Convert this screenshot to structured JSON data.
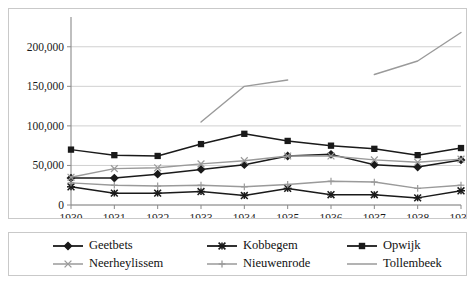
{
  "chart_data": {
    "type": "line",
    "title": "",
    "xlabel": "",
    "ylabel": "",
    "x": [
      1930,
      1931,
      1932,
      1933,
      1934,
      1935,
      1936,
      1937,
      1938,
      1939
    ],
    "xtick_labels": [
      "1930",
      "1931",
      "1932",
      "1933",
      "1934",
      "1935",
      "1936",
      "1937",
      "1938",
      "1939"
    ],
    "ytick_labels": [
      "0",
      "50,000",
      "100,000",
      "150,000",
      "200,000"
    ],
    "ytick_values": [
      0,
      50000,
      100000,
      150000,
      200000
    ],
    "ylim": [
      0,
      225000
    ],
    "xlim": [
      1930,
      1939
    ],
    "grid": true,
    "legend_position": "bottom",
    "series": [
      {
        "name": "Geetbets",
        "marker": "diamond",
        "color": "#1a1a1a",
        "values": [
          34000,
          34000,
          39000,
          45000,
          51000,
          62000,
          64000,
          51000,
          48000,
          57000
        ]
      },
      {
        "name": "Kobbegem",
        "marker": "asterisk",
        "color": "#1a1a1a",
        "values": [
          23000,
          15000,
          15000,
          17000,
          12000,
          21000,
          13000,
          13000,
          9000,
          18000
        ]
      },
      {
        "name": "Opwijk",
        "marker": "square",
        "color": "#1a1a1a",
        "values": [
          70000,
          63000,
          62000,
          77000,
          90000,
          81000,
          75000,
          71000,
          63000,
          72000
        ]
      },
      {
        "name": "Neerheylissem",
        "marker": "x",
        "color": "#9a9a9a",
        "values": [
          35000,
          46000,
          47000,
          52000,
          56000,
          62000,
          62000,
          57000,
          54000,
          58000
        ]
      },
      {
        "name": "Nieuwenrode",
        "marker": "plus",
        "color": "#9a9a9a",
        "values": [
          28000,
          25000,
          24000,
          25000,
          23000,
          26000,
          30000,
          29000,
          21000,
          25000
        ]
      },
      {
        "name": "Tollembeek",
        "marker": "none",
        "color": "#9a9a9a",
        "segments": [
          {
            "x": [
              1933,
              1934,
              1935
            ],
            "values": [
              105000,
              150000,
              158000
            ]
          },
          {
            "x": [
              1937,
              1938,
              1939
            ],
            "values": [
              165000,
              182000,
              218000
            ]
          }
        ]
      }
    ]
  },
  "legend": {
    "items": [
      {
        "label": "Geetbets",
        "marker": "diamond",
        "color": "#1a1a1a"
      },
      {
        "label": "Kobbegem",
        "marker": "asterisk",
        "color": "#1a1a1a"
      },
      {
        "label": "Opwijk",
        "marker": "square",
        "color": "#1a1a1a"
      },
      {
        "label": "Neerheylissem",
        "marker": "x",
        "color": "#9a9a9a"
      },
      {
        "label": "Nieuwenrode",
        "marker": "plus",
        "color": "#9a9a9a"
      },
      {
        "label": "Tollembeek",
        "marker": "none",
        "color": "#9a9a9a"
      }
    ]
  }
}
